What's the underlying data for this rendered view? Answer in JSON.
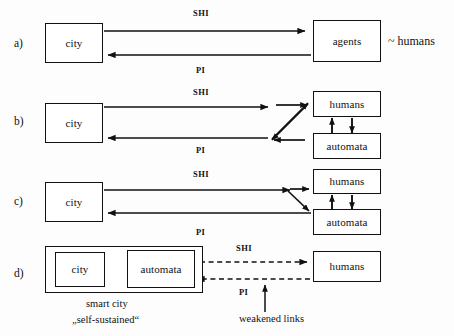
{
  "figure": {
    "background_color": "#fdfdfd",
    "ink_color": "#111111",
    "row_labels": {
      "a": "a)",
      "b": "b)",
      "c": "c)",
      "d": "d)"
    },
    "edge_labels": {
      "shi": "SHI",
      "pi": "PI"
    },
    "annotations": {
      "approx_humans": "~ humans",
      "smart_city_line1": "smart city",
      "smart_city_line2": "„self-sustained“",
      "weakened_links": "weakened links"
    }
  },
  "rows": [
    {
      "id": "a",
      "label": "a)",
      "nodes": [
        {
          "id": "city-a",
          "label": "city"
        },
        {
          "id": "agents-a",
          "label": "agents"
        }
      ],
      "edges": [
        {
          "id": "a-shi",
          "label": "SHI",
          "from": "city",
          "to": "agents",
          "style": "solid"
        },
        {
          "id": "a-pi",
          "label": "PI",
          "from": "agents",
          "to": "city",
          "style": "solid"
        }
      ],
      "note": "~ humans"
    },
    {
      "id": "b",
      "label": "b)",
      "nodes": [
        {
          "id": "city-b",
          "label": "city"
        },
        {
          "id": "humans-b",
          "label": "humans"
        },
        {
          "id": "automata-b",
          "label": "automata"
        }
      ],
      "edges": [
        {
          "id": "b-shi",
          "label": "SHI",
          "from": "city",
          "to": "crossing",
          "style": "solid"
        },
        {
          "id": "b-pi",
          "label": "PI",
          "from": "crossing",
          "to": "city",
          "style": "solid"
        },
        {
          "id": "b-cross",
          "label": "",
          "from": "crossing",
          "to": "humans-automata",
          "style": "crossed"
        },
        {
          "id": "b-vert",
          "label": "",
          "from": "humans",
          "to": "automata",
          "style": "bidirectional"
        }
      ]
    },
    {
      "id": "c",
      "label": "c)",
      "nodes": [
        {
          "id": "city-c",
          "label": "city"
        },
        {
          "id": "humans-c",
          "label": "humans"
        },
        {
          "id": "automata-c",
          "label": "automata"
        }
      ],
      "edges": [
        {
          "id": "c-shi",
          "label": "SHI",
          "from": "city",
          "to": "fork",
          "style": "solid"
        },
        {
          "id": "c-pi",
          "label": "PI",
          "from": "automata",
          "to": "city",
          "style": "solid"
        },
        {
          "id": "c-fork",
          "label": "",
          "from": "fork",
          "to": "humans-automata",
          "style": "fork"
        },
        {
          "id": "c-vert",
          "label": "",
          "from": "humans",
          "to": "automata",
          "style": "bidirectional"
        }
      ]
    },
    {
      "id": "d",
      "label": "d)",
      "nodes": [
        {
          "id": "city-d",
          "label": "city"
        },
        {
          "id": "automata-d",
          "label": "automata"
        },
        {
          "id": "humans-d",
          "label": "humans"
        }
      ],
      "group": {
        "id": "smart-city-group",
        "caption_line1": "smart city",
        "caption_line2": "„self-sustained“"
      },
      "edges": [
        {
          "id": "d-city-automata",
          "label": "",
          "from": "city",
          "to": "automata",
          "style": "solid"
        },
        {
          "id": "d-automata-city",
          "label": "",
          "from": "automata",
          "to": "city",
          "style": "solid"
        },
        {
          "id": "d-shi",
          "label": "SHI",
          "from": "smart-city",
          "to": "humans",
          "style": "dashed"
        },
        {
          "id": "d-pi",
          "label": "PI",
          "from": "humans",
          "to": "smart-city",
          "style": "dashed"
        }
      ],
      "callout": "weakened links"
    }
  ]
}
